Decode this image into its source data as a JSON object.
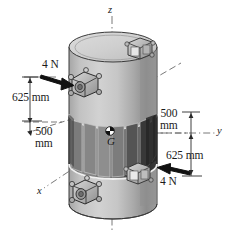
{
  "figure": {
    "type": "engineering-mechanics-diagram",
    "background_color": "#ffffff",
    "ink_color": "#1a1a1a"
  },
  "axes": {
    "z": {
      "label": "z",
      "orientation": "vertical-up",
      "style": "dash-dot center line"
    },
    "y": {
      "label": "y",
      "orientation": "right",
      "style": "dash-dot"
    },
    "x": {
      "label": "x",
      "orientation": "lower-left",
      "style": "dash-dot"
    }
  },
  "body": {
    "name": "cylinder",
    "fill": "#c4c4c4",
    "top_fill": "#d6d6d6",
    "shadow_fill": "#9a9a9a",
    "band_fill": "#3a3a3a",
    "panel_fill": "#6e6e6e",
    "outline": "#2b2b2b"
  },
  "center_of_gravity": {
    "label": "G",
    "marker": "half-filled-circle"
  },
  "forces": [
    {
      "id": "force-top-left",
      "label": "4 N",
      "magnitude": 4,
      "unit": "N",
      "direction": "points right-down toward upper clamp",
      "color": "#111111"
    },
    {
      "id": "force-bottom-right",
      "label": "4 N",
      "magnitude": 4,
      "unit": "N",
      "direction": "points left-up toward lower clamp",
      "color": "#111111"
    }
  ],
  "dimensions": [
    {
      "id": "dim-left-625",
      "label": "625 mm",
      "value": 625,
      "unit": "mm",
      "side": "left",
      "from": "upper force line",
      "to": "upper edge of central band"
    },
    {
      "id": "dim-left-500",
      "label_line1": "500",
      "label_line2": "mm",
      "value": 500,
      "unit": "mm",
      "side": "left",
      "from": "upper band edge",
      "to": "G plane"
    },
    {
      "id": "dim-right-500",
      "label_line1": "500",
      "label_line2": "mm",
      "value": 500,
      "unit": "mm",
      "side": "right",
      "from": "G plane",
      "to": "y axis"
    },
    {
      "id": "dim-right-625",
      "label": "625 mm",
      "value": 625,
      "unit": "mm",
      "side": "right",
      "from": "y axis",
      "to": "lower force line"
    }
  ],
  "hardware": [
    {
      "id": "clamp-top-back",
      "type": "cube-bracket",
      "position": "top rim far side"
    },
    {
      "id": "clamp-top-front",
      "type": "cube-bracket-with-hole",
      "position": "upper front, force application point"
    },
    {
      "id": "clamp-bottom-right",
      "type": "cube-bracket",
      "position": "lower right, force application point"
    },
    {
      "id": "clamp-bottom-front",
      "type": "cube-bracket-with-hole",
      "position": "bottom front"
    }
  ]
}
